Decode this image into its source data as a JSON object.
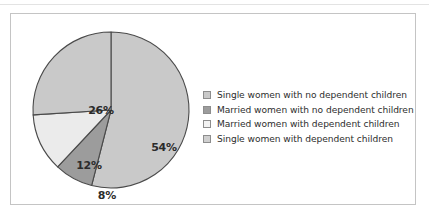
{
  "chart_data": {
    "type": "pie",
    "title": "",
    "subtitle": "",
    "xlabel": "",
    "ylabel": "",
    "grid": false,
    "legend_position": "right",
    "start_angle_deg": 0,
    "direction": "clockwise",
    "categories": [
      "Single women with no dependent children",
      "Married women with no dependent children",
      "Married women with dependent children",
      "Single women with dependent children"
    ],
    "values": [
      54,
      26,
      12,
      8
    ],
    "value_labels": [
      "54%",
      "26%",
      "12%",
      "8%"
    ],
    "slices": [
      {
        "label": "Single women with no dependent children",
        "value": 54,
        "value_label": "54%",
        "color": "#c9c9c9",
        "start_deg": 0,
        "end_deg": 194.4,
        "label_x": 133,
        "label_y": 118
      },
      {
        "label": "Single women with dependent children",
        "value": 8,
        "value_label": "8%",
        "color": "#9c9c9c",
        "start_deg": 194.4,
        "end_deg": 223.2,
        "label_x": 76,
        "label_y": 166
      },
      {
        "label": "Married women with dependent children",
        "value": 12,
        "value_label": "12%",
        "color": "#ebebeb",
        "start_deg": 223.2,
        "end_deg": 266.4,
        "label_x": 58,
        "label_y": 136
      },
      {
        "label": "Married women with no dependent children",
        "value": 26,
        "value_label": "26%",
        "color": "#c9c9c9",
        "start_deg": 266.4,
        "end_deg": 360,
        "label_x": 70,
        "label_y": 81
      }
    ]
  },
  "legend": {
    "entries": [
      {
        "label": "Single women with no dependent children",
        "color": "#c9c9c9"
      },
      {
        "label": "Married women with no dependent children",
        "color": "#9c9c9c"
      },
      {
        "label": "Married women with dependent children",
        "color": "#f2f2f2"
      },
      {
        "label": "Single women with dependent children",
        "color": "#cfcfcf"
      }
    ]
  },
  "colors": {
    "frame_border": "#c4c4c4",
    "background": "#ffffff",
    "slice_outline": "#4a4a4a",
    "label_text": "#2b2b2b",
    "legend_text": "#2e2e2e"
  }
}
